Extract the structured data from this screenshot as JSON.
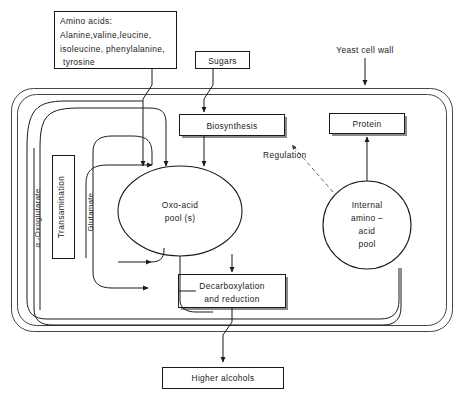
{
  "figure": {
    "caption": "",
    "colors": {
      "ink": "#1a1a1a",
      "wall": "#444444",
      "dashed": "#555555",
      "paper": "#ffffff"
    }
  },
  "nodes": {
    "amino_acids_input": {
      "lines": [
        "Amino acids:",
        "Alanine,valine,leucine,",
        "isoleucine, phenylalanine,",
        "tyrosine"
      ]
    },
    "sugars_input": {
      "label": "Sugars"
    },
    "yeast_cell_wall": {
      "label": "Yeast cell wall"
    },
    "biosynthesis": {
      "label": "Biosynthesis"
    },
    "protein": {
      "label": "Protein"
    },
    "oxo_acid_pool": {
      "lines": [
        "Oxo-acid",
        "pool (s)"
      ]
    },
    "internal_pool": {
      "lines": [
        "Internal",
        "amino –",
        "acid",
        "pool"
      ]
    },
    "decarboxylation": {
      "lines": [
        "Decarboxylation",
        "and reduction"
      ]
    },
    "higher_alcohols": {
      "label": "Higher alcohols"
    },
    "transamination": {
      "label": "Transamination"
    }
  },
  "edge_labels": {
    "alpha_oxoglutarate": "α -Oxoglutarate",
    "glutamate": "Glutamate",
    "regulation": "Regulation"
  }
}
